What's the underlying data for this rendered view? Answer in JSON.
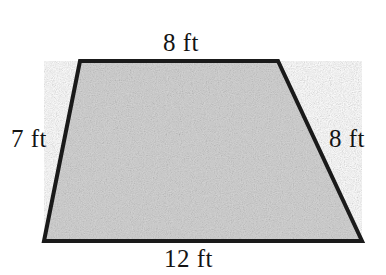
{
  "figure": {
    "name": "trapezoid-diagram",
    "shape_type": "trapezoid",
    "units": "ft",
    "background_color": "#ffffff",
    "fill_color": "#c9c9c9",
    "stroke_color": "#1a1a1a",
    "stroke_width_px": 4,
    "vertices": {
      "top_left": [
        80,
        61
      ],
      "top_right": [
        278,
        61
      ],
      "bottom_right": [
        362,
        241
      ],
      "bottom_left": [
        44,
        241
      ]
    },
    "labels": {
      "top": "8 ft",
      "right": "8 ft",
      "bottom": "12 ft",
      "left": "7 ft"
    },
    "measurements": [
      {
        "side": "top",
        "value": 8,
        "unit": "ft",
        "text": "8 ft"
      },
      {
        "side": "right",
        "value": 8,
        "unit": "ft",
        "text": "8 ft"
      },
      {
        "side": "bottom",
        "value": 12,
        "unit": "ft",
        "text": "12 ft"
      },
      {
        "side": "left",
        "value": 7,
        "unit": "ft",
        "text": "7 ft"
      }
    ]
  }
}
